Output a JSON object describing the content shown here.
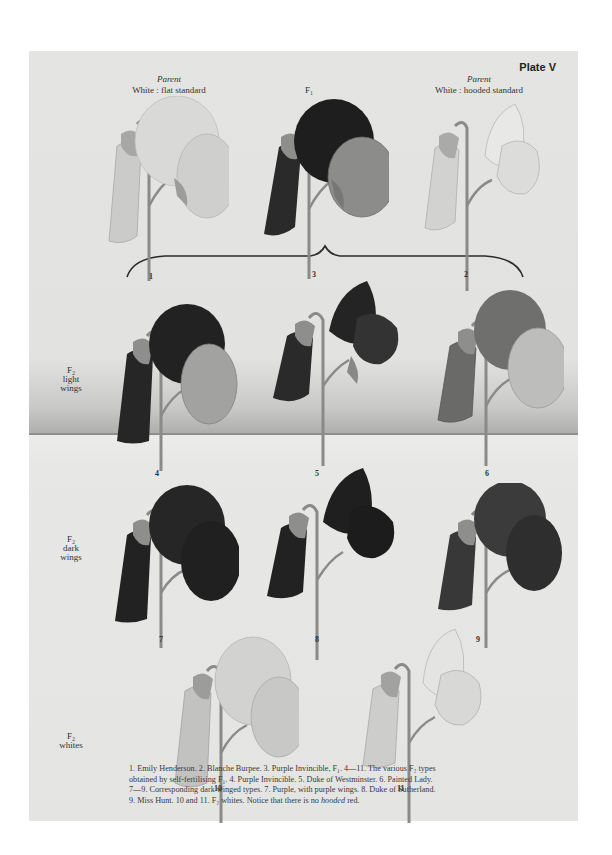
{
  "plate": {
    "label": "Plate V",
    "columns": {
      "left": {
        "italic": "Parent",
        "text": "White : flat standard"
      },
      "center": {
        "text": "F₁"
      },
      "right": {
        "italic": "Parent",
        "text": "White : hooded standard"
      }
    },
    "row_labels": [
      {
        "line1": "F₂",
        "line2": "light",
        "line3": "wings"
      },
      {
        "line1": "F₂",
        "line2": "dark",
        "line3": "wings"
      },
      {
        "line1": "F₂",
        "line2": "whites",
        "line3": ""
      }
    ],
    "figures": [
      {
        "number": "1",
        "standard": "#d9d9d7",
        "wing": "#cfcfcd",
        "bud": "#c6c6c4"
      },
      {
        "number": "3",
        "standard": "#1e1e1e",
        "wing": "#8c8c8a",
        "bud": "#2a2a2a"
      },
      {
        "number": "2",
        "standard": "#e8e8e6",
        "wing": "#dcdcda",
        "bud": "#cfcfcd"
      },
      {
        "number": "4",
        "standard": "#222222",
        "wing": "#a2a2a0",
        "bud": "#262626"
      },
      {
        "number": "5",
        "standard": "#242424",
        "wing": "#333333",
        "bud": "#2a2a2a"
      },
      {
        "number": "6",
        "standard": "#6f6f6d",
        "wing": "#bdbdbb",
        "bud": "#6a6a68"
      },
      {
        "number": "7",
        "standard": "#262626",
        "wing": "#202020",
        "bud": "#222222"
      },
      {
        "number": "8",
        "standard": "#1f1f1f",
        "wing": "#1c1c1c",
        "bud": "#222222"
      },
      {
        "number": "9",
        "standard": "#3b3b3b",
        "wing": "#2e2e2e",
        "bud": "#383838"
      },
      {
        "number": "10",
        "standard": "#d2d2d0",
        "wing": "#c8c8c6",
        "bud": "#bdbdbb"
      },
      {
        "number": "11",
        "standard": "#e4e4e2",
        "wing": "#d8d8d6",
        "bud": "#c8c8c6"
      }
    ],
    "caption": {
      "line1": "1.  Emily Henderson.     2.  Blanche Burpee.     3.  Purple Invincible, F₁.     4—11.  The various F₂ types",
      "line2": "obtained by self-fertilising F₁.     4.  Purple Invincible.     5.  Duke of Westminster.     6.  Painted Lady.",
      "line3": "7—9.  Corresponding dark winged types.     7.  Purple, with purple wings.     8.  Duke of Sutherland.",
      "line4_a": "9.  Miss Hunt.     10 and 11.  F₂ whites.     Notice that there is no ",
      "line4_em": "hooded",
      "line4_b": " red."
    }
  }
}
